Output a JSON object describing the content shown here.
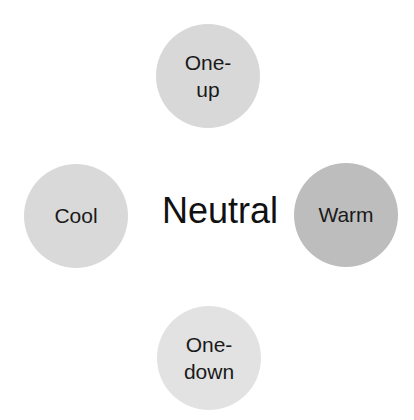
{
  "diagram": {
    "center": {
      "label": "Neutral"
    },
    "nodes": [
      {
        "id": "top",
        "label": "One-\nup",
        "lines": [
          "One-",
          "up"
        ],
        "color": "#d9d9d9"
      },
      {
        "id": "left",
        "label": "Cool",
        "color": "#d9d9d9"
      },
      {
        "id": "right",
        "label": "Warm",
        "color": "#bfbfbf"
      },
      {
        "id": "bottom",
        "label": "One-\ndown",
        "lines": [
          "One-",
          "down"
        ],
        "color": "#e3e3e3"
      }
    ]
  }
}
